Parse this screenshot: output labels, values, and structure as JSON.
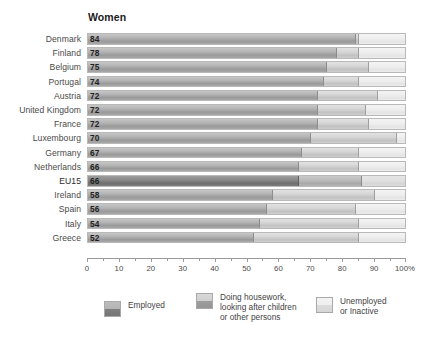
{
  "chart_data": {
    "type": "bar",
    "orientation": "horizontal",
    "stacked": true,
    "normalized_percent": true,
    "title": "Women",
    "xlabel": "",
    "ylabel": "",
    "xlim": [
      0,
      100
    ],
    "grid": false,
    "legend_position": "bottom",
    "axis_unit_suffix": "%",
    "tick_values": [
      0,
      10,
      20,
      30,
      40,
      50,
      60,
      70,
      80,
      90,
      100
    ],
    "tick_labels": [
      "0",
      "10",
      "20",
      "30",
      "40",
      "50",
      "60",
      "70",
      "80",
      "90",
      "100%"
    ],
    "minor_tick_values": [
      5,
      15,
      25,
      35,
      45,
      55,
      65,
      75,
      85,
      95
    ],
    "categories": [
      "Denmark",
      "Finland",
      "Belgium",
      "Portugal",
      "Austria",
      "United Kingdom",
      "France",
      "Luxembourg",
      "Germany",
      "Netherlands",
      "EU15",
      "Ireland",
      "Spain",
      "Italy",
      "Greece"
    ],
    "highlight_category": "EU15",
    "series": [
      {
        "name": "Employed",
        "color": "#a8a8a8",
        "values": [
          84,
          78,
          75,
          74,
          72,
          72,
          72,
          70,
          67,
          66,
          66,
          58,
          56,
          54,
          52
        ]
      },
      {
        "name": "Doing housework, looking after children or other persons",
        "color": "#cdcdcd",
        "values": [
          1,
          7,
          13,
          11,
          19,
          15,
          16,
          27,
          18,
          19,
          20,
          32,
          28,
          31,
          33
        ]
      },
      {
        "name": "Unemployed or Inactive",
        "color": "#ededed",
        "values": [
          15,
          15,
          12,
          15,
          9,
          13,
          12,
          3,
          15,
          15,
          14,
          10,
          16,
          15,
          15
        ]
      }
    ],
    "data_labels": {
      "series": "Employed",
      "values": [
        "84",
        "78",
        "75",
        "74",
        "72",
        "72",
        "72",
        "70",
        "67",
        "66",
        "66",
        "58",
        "56",
        "54",
        "52"
      ]
    }
  },
  "legend": {
    "items": [
      {
        "label": "Employed",
        "swatch": "sw-employed"
      },
      {
        "label": "Doing housework,\nlooking after children\nor other persons",
        "swatch": "sw-housework"
      },
      {
        "label": "Unemployed\nor Inactive",
        "swatch": "sw-inactive"
      }
    ]
  }
}
